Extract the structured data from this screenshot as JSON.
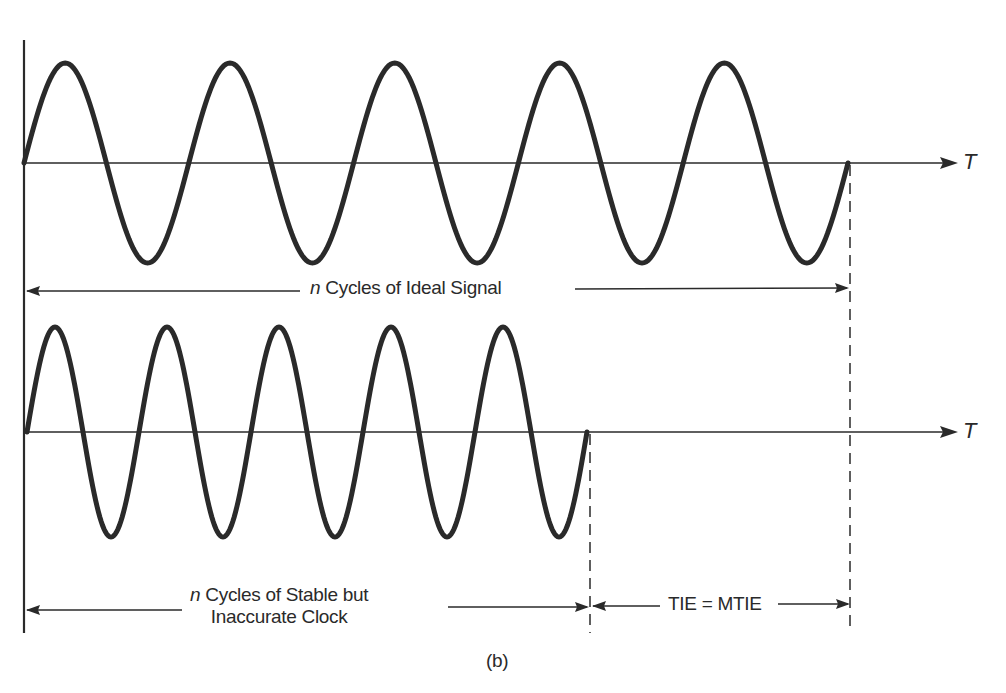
{
  "figure": {
    "caption": "(b)",
    "axis_label": "T",
    "top_panel": {
      "label_italic": "n",
      "label_rest": " Cycles of Ideal Signal",
      "cycles": 5,
      "x_start": 24,
      "x_end": 848,
      "baseline_y": 163,
      "amplitude": 100
    },
    "bottom_panel": {
      "label_italic": "n",
      "label_line1_rest": " Cycles of Stable but",
      "label_line2": "Inaccurate Clock",
      "cycles": 5,
      "x_start": 27,
      "x_end": 587,
      "baseline_y": 432,
      "amplitude": 105
    },
    "error_label": "TIE = MTIE",
    "colors": {
      "ink": "#2a2a2a",
      "background": "#ffffff"
    }
  }
}
